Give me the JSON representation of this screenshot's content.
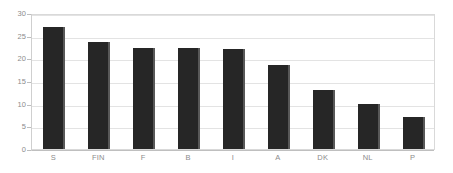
{
  "chart_data": {
    "type": "bar",
    "title": "",
    "subtitle": "",
    "xlabel": "",
    "ylabel": "",
    "categories": [
      "S",
      "FIN",
      "F",
      "B",
      "I",
      "A",
      "DK",
      "NL",
      "P"
    ],
    "values": [
      27,
      23.5,
      22.3,
      22.3,
      22,
      18.5,
      13,
      10,
      7
    ],
    "series": [
      {
        "name": "",
        "values": [
          27,
          23.5,
          22.3,
          22.3,
          22,
          18.5,
          13,
          10,
          7
        ]
      }
    ],
    "ylim": [
      0,
      30
    ],
    "yticks": [
      0,
      5,
      10,
      15,
      20,
      25,
      30
    ],
    "ytick_labels": [
      "0",
      "5",
      "10",
      "15",
      "20",
      "25",
      "30"
    ],
    "grid": true,
    "grid_axis": "y",
    "legend": false,
    "legend_position": "none",
    "annotations": [],
    "colors": {
      "bar_fill": "#262626",
      "bar_edge_highlight": "#585858",
      "gridline": "#e3e3e3",
      "axis_line": "#cfcfcf",
      "plot_border": "#d9d9d9",
      "tick_label": "#8c8c8c",
      "background": "#ffffff"
    }
  }
}
